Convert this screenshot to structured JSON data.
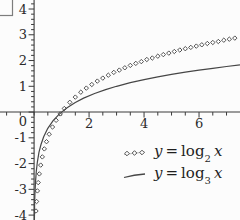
{
  "chart_data": {
    "type": "line",
    "title": "",
    "xlabel": "x",
    "ylabel": "y",
    "xlim": [
      -1.24,
      7.49
    ],
    "ylim": [
      -4.19,
      4.35
    ],
    "grid": false,
    "axes_color": "#3a3a3a",
    "text_color": "#2a2a2a",
    "x_ticks": {
      "minor_step": 0.5,
      "labels": [
        {
          "v": 2,
          "t": "2"
        },
        {
          "v": 4,
          "t": "4"
        },
        {
          "v": 6,
          "t": "6"
        }
      ]
    },
    "y_ticks": {
      "minor_step": 0.2,
      "labels": [
        {
          "v": 4,
          "t": "4"
        },
        {
          "v": 3,
          "t": "3"
        },
        {
          "v": 2,
          "t": "2"
        },
        {
          "v": 1,
          "t": "1"
        },
        {
          "v": 0,
          "t": "0"
        },
        {
          "v": -1,
          "t": "-1"
        },
        {
          "v": -2,
          "t": "-2"
        },
        {
          "v": -3,
          "t": "-3"
        },
        {
          "v": -4,
          "t": "-4"
        }
      ]
    },
    "series": [
      {
        "name": "y = log2 x",
        "style": "markers",
        "marker": "open-diamond",
        "color": "#404040",
        "points": [
          [
            0.07,
            -3.84
          ],
          [
            0.09,
            -3.47
          ],
          [
            0.12,
            -3.06
          ],
          [
            0.15,
            -2.74
          ],
          [
            0.19,
            -2.4
          ],
          [
            0.24,
            -2.06
          ],
          [
            0.3,
            -1.74
          ],
          [
            0.37,
            -1.43
          ],
          [
            0.45,
            -1.15
          ],
          [
            0.55,
            -0.86
          ],
          [
            0.67,
            -0.58
          ],
          [
            0.8,
            -0.32
          ],
          [
            0.95,
            -0.07
          ],
          [
            1.1,
            0.14
          ],
          [
            1.3,
            0.38
          ],
          [
            1.5,
            0.58
          ],
          [
            1.7,
            0.77
          ],
          [
            1.9,
            0.93
          ],
          [
            2.1,
            1.07
          ],
          [
            2.3,
            1.2
          ],
          [
            2.5,
            1.32
          ],
          [
            2.7,
            1.43
          ],
          [
            2.9,
            1.54
          ],
          [
            3.1,
            1.63
          ],
          [
            3.3,
            1.72
          ],
          [
            3.5,
            1.81
          ],
          [
            3.7,
            1.89
          ],
          [
            3.9,
            1.96
          ],
          [
            4.1,
            2.04
          ],
          [
            4.3,
            2.1
          ],
          [
            4.5,
            2.17
          ],
          [
            4.7,
            2.23
          ],
          [
            4.9,
            2.29
          ],
          [
            5.1,
            2.35
          ],
          [
            5.3,
            2.41
          ],
          [
            5.5,
            2.46
          ],
          [
            5.7,
            2.51
          ],
          [
            5.9,
            2.56
          ],
          [
            6.1,
            2.61
          ],
          [
            6.3,
            2.66
          ],
          [
            6.5,
            2.7
          ],
          [
            6.7,
            2.74
          ],
          [
            6.9,
            2.79
          ],
          [
            7.1,
            2.83
          ],
          [
            7.3,
            2.87
          ]
        ]
      },
      {
        "name": "y = log3 x",
        "style": "line",
        "color": "#464646",
        "points": [
          [
            0.01,
            -4.19
          ],
          [
            0.02,
            -3.56
          ],
          [
            0.03,
            -3.19
          ],
          [
            0.05,
            -2.73
          ],
          [
            0.08,
            -2.3
          ],
          [
            0.12,
            -1.93
          ],
          [
            0.18,
            -1.56
          ],
          [
            0.25,
            -1.26
          ],
          [
            0.35,
            -0.96
          ],
          [
            0.5,
            -0.63
          ],
          [
            0.7,
            -0.32
          ],
          [
            0.9,
            -0.1
          ],
          [
            1,
            0
          ],
          [
            1.2,
            0.17
          ],
          [
            1.5,
            0.37
          ],
          [
            1.8,
            0.54
          ],
          [
            2.2,
            0.72
          ],
          [
            2.6,
            0.87
          ],
          [
            3,
            1
          ],
          [
            3.5,
            1.14
          ],
          [
            4,
            1.26
          ],
          [
            4.5,
            1.37
          ],
          [
            5,
            1.46
          ],
          [
            5.5,
            1.55
          ],
          [
            6,
            1.63
          ],
          [
            6.5,
            1.7
          ],
          [
            7,
            1.77
          ],
          [
            7.49,
            1.83
          ]
        ]
      }
    ],
    "legend": {
      "position": "bottom-right",
      "entries": [
        {
          "var": "y",
          "eq": "=",
          "fn": "log",
          "base": "2",
          "arg": "x"
        },
        {
          "var": "y",
          "eq": "=",
          "fn": "log",
          "base": "3",
          "arg": "x"
        }
      ]
    }
  }
}
